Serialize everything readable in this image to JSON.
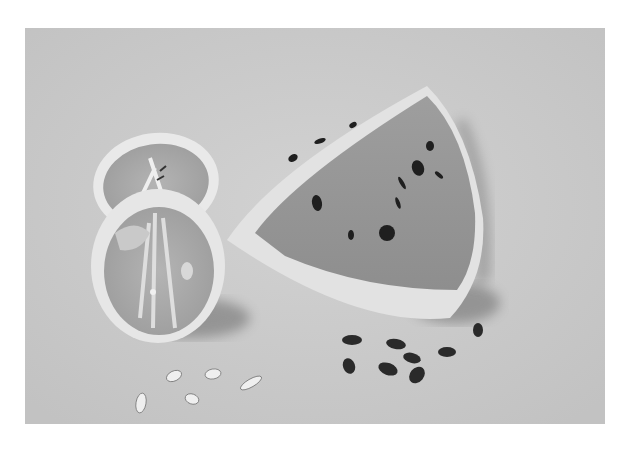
{
  "image": {
    "kind": "grayscale still-life photograph",
    "subjects": [
      "half citrus slice (top)",
      "half citrus slice (front)",
      "watermelon wedge",
      "citrus seeds",
      "watermelon seeds"
    ],
    "counts": {
      "citrus_seeds": 5,
      "watermelon_seeds": 8
    },
    "colors": {
      "background": "#c9c9c9",
      "frame": "#ffffff",
      "citrus_rind": "#e8e8e8",
      "citrus_flesh": "#a8a8a8",
      "watermelon_flesh": "#9a9a9a",
      "watermelon_rind": "#e2e2e2",
      "seed_dark": "#2a2a2a",
      "seed_light": "#efefef"
    }
  }
}
